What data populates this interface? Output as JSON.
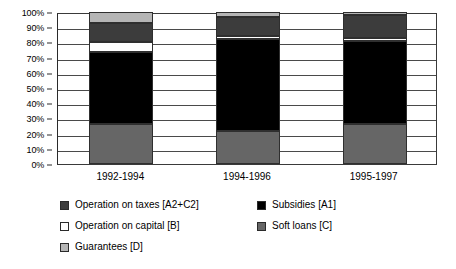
{
  "chart_data": {
    "type": "bar",
    "subtype": "stacked-percent",
    "title": "",
    "xlabel": "",
    "ylabel": "",
    "ylim": [
      0,
      100
    ],
    "y_unit": "%",
    "grid": true,
    "legend_position": "bottom",
    "categories": [
      "1992-1994",
      "1994-1996",
      "1995-1997"
    ],
    "y_ticks": [
      "0%",
      "10%",
      "20%",
      "30%",
      "40%",
      "50%",
      "60%",
      "70%",
      "80%",
      "90%",
      "100%"
    ],
    "y_tick_values": [
      0,
      10,
      20,
      30,
      40,
      50,
      60,
      70,
      80,
      90,
      100
    ],
    "series": [
      {
        "name": "Soft loans [C]",
        "key": "soft-loans",
        "color": "#666666",
        "values": [
          26,
          22,
          26
        ]
      },
      {
        "name": "Subsidies [A1]",
        "key": "subsidies",
        "color": "#000000",
        "values": [
          48,
          60,
          55
        ]
      },
      {
        "name": "Operation on capital [B]",
        "key": "operation-on-capital",
        "color": "#ffffff",
        "values": [
          6,
          2,
          2
        ]
      },
      {
        "name": "Operation on taxes [A2+C2]",
        "key": "operation-on-taxes",
        "color": "#3c3c3c",
        "values": [
          13,
          13,
          15
        ]
      },
      {
        "name": "Guarantees [D]",
        "key": "guarantees",
        "color": "#b5b5b5",
        "values": [
          7,
          3,
          2
        ]
      }
    ],
    "cumulative_tops": {
      "1992-1994": {
        "soft-loans": 26,
        "subsidies": 74,
        "operation-on-capital": 80,
        "operation-on-taxes": 93,
        "guarantees": 100
      },
      "1994-1996": {
        "soft-loans": 22,
        "subsidies": 82,
        "operation-on-capital": 84,
        "operation-on-taxes": 97,
        "guarantees": 100
      },
      "1995-1997": {
        "soft-loans": 26,
        "subsidies": 82,
        "operation-on-capital": 84,
        "operation-on-taxes": 98,
        "guarantees": 100
      }
    }
  },
  "legend": {
    "entries": [
      {
        "label": "Operation on taxes [A2+C2]",
        "color": "#3c3c3c",
        "icon": "legend-swatch-operation-on-taxes"
      },
      {
        "label": "Subsidies [A1]",
        "color": "#000000",
        "icon": "legend-swatch-subsidies"
      },
      {
        "label": "Operation on capital [B]",
        "color": "#ffffff",
        "icon": "legend-swatch-operation-on-capital"
      },
      {
        "label": "Soft loans [C]",
        "color": "#666666",
        "icon": "legend-swatch-soft-loans"
      },
      {
        "label": "Guarantees [D]",
        "color": "#b5b5b5",
        "icon": "legend-swatch-guarantees"
      }
    ]
  },
  "axis": {
    "frame_color": "#3a3a3a",
    "gridline_color": "#4a4a4a"
  }
}
